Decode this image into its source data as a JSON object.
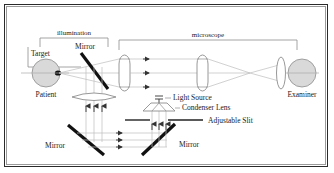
{
  "diagram": {
    "labels": {
      "illumination": "illumination",
      "microscope": "microscope",
      "target": "Target",
      "patient": "Patient",
      "examiner": "Examiner",
      "mirror_top": "Mirror",
      "mirror_bottom_left": "Mirror",
      "mirror_bottom_right": "Mirror",
      "light_source": "Light Source",
      "condenser_lens": "Condenser Lens",
      "adjustable_slit": "Adjustable Slit"
    },
    "colors": {
      "border_outer": "#2a2a2a",
      "border_inner": "#9a9a9a",
      "background": "#ffffff",
      "ray": "#a9a9a9",
      "optic_outline": "#8d8d8d",
      "eye_fill": "#d9d9d9",
      "mirror": "#111111",
      "text": "#1a1a1a",
      "bracket": "#8d8d8d"
    }
  }
}
